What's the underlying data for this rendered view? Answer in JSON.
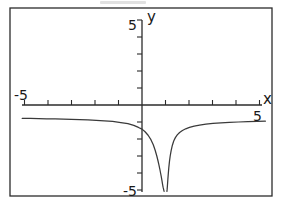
{
  "figure": {
    "name": "coordinate-plane-graph",
    "frame": {
      "x": 10,
      "y": 8,
      "width": 262,
      "height": 188,
      "stroke": "#2b2b2b"
    },
    "ink_color": "#2b2b2b",
    "curve_color": "#3a3a3a",
    "background": "#ffffff"
  },
  "axes": {
    "x_label": "x",
    "y_label": "y",
    "x_min_label": "-5",
    "x_max_label": "5",
    "y_min_label": "-5",
    "y_max_label": "5",
    "origin_px": {
      "x": 142,
      "y": 105
    },
    "unit_px": {
      "x": 23.5,
      "y": 17.0
    },
    "x_axis_px": {
      "x1": 22,
      "x2": 262,
      "y": 105
    },
    "y_axis_px": {
      "x": 142,
      "y1": 20,
      "y2": 192
    },
    "x_ticks": [
      -5,
      -4,
      -3,
      -2,
      -1,
      1,
      2,
      3,
      4,
      5
    ],
    "y_ticks": [
      -5,
      -4,
      -3,
      -2,
      -1,
      1,
      2,
      3,
      4,
      5
    ],
    "tick_len_px": 5,
    "grid": false
  },
  "chart_data": {
    "type": "line",
    "title": "",
    "xlabel": "x",
    "ylabel": "y",
    "xlim": [
      -5,
      5
    ],
    "ylim": [
      -5,
      5
    ],
    "grid": false,
    "legend": null,
    "annotations": [],
    "asymptote_x": 1.0,
    "horizontal_asymptote_y": -1.0,
    "series": [
      {
        "name": "left-branch",
        "x": [
          -5.1,
          -4.75,
          -4.4,
          -4.05,
          -3.7,
          -3.35,
          -3.0,
          -2.65,
          -2.3,
          -1.95,
          -1.6,
          -1.25,
          -0.9,
          -0.6,
          -0.35,
          -0.15,
          0.0,
          0.12,
          0.26,
          0.38,
          0.48,
          0.56,
          0.63,
          0.68,
          0.72,
          0.76,
          0.79,
          0.82,
          0.85,
          0.87,
          0.89,
          0.905,
          0.92,
          0.93,
          0.94
        ],
        "y": [
          -0.78,
          -0.79,
          -0.8,
          -0.81,
          -0.82,
          -0.83,
          -0.85,
          -0.86,
          -0.88,
          -0.9,
          -0.93,
          -0.97,
          -1.03,
          -1.1,
          -1.2,
          -1.32,
          -1.42,
          -1.56,
          -1.78,
          -2.04,
          -2.34,
          -2.66,
          -3.0,
          -3.28,
          -3.52,
          -3.78,
          -4.0,
          -4.22,
          -4.45,
          -4.62,
          -4.78,
          -4.88,
          -4.96,
          -5.02,
          -5.08
        ]
      },
      {
        "name": "right-branch",
        "x": [
          1.06,
          1.07,
          1.08,
          1.09,
          1.1,
          1.12,
          1.14,
          1.17,
          1.2,
          1.24,
          1.29,
          1.35,
          1.42,
          1.5,
          1.6,
          1.72,
          1.86,
          2.02,
          2.22,
          2.45,
          2.72,
          3.02,
          3.36,
          3.72,
          4.1,
          4.5,
          4.9,
          5.25
        ],
        "y": [
          -5.08,
          -4.95,
          -4.78,
          -4.58,
          -4.38,
          -4.02,
          -3.7,
          -3.3,
          -3.0,
          -2.68,
          -2.38,
          -2.12,
          -1.92,
          -1.76,
          -1.62,
          -1.5,
          -1.4,
          -1.32,
          -1.24,
          -1.18,
          -1.13,
          -1.08,
          -1.05,
          -1.02,
          -1.0,
          -0.98,
          -0.96,
          -0.95
        ]
      }
    ]
  },
  "labels": {
    "y_top": "5",
    "y_bottom": "-5",
    "x_left": "-5",
    "x_right": "5",
    "axis_x": "x",
    "axis_y": "y"
  }
}
